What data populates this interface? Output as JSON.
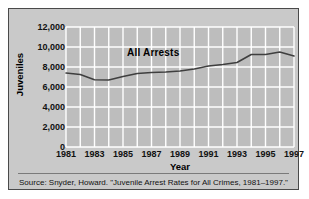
{
  "figure": {
    "series_annotation": "All Arrests",
    "source_caption": "Source: Snyder, Howard. \"Juvenile Arrest Rates for All Crimes, 1981–1997.\"",
    "colors": {
      "panel_background": "#c9c9c9",
      "plot_background": "#bdbdbd",
      "gridline": "#ffffff",
      "line": "#3f3f3f",
      "border": "#4a4a4a",
      "text": "#111111"
    }
  },
  "chart_data": {
    "type": "line",
    "title": "",
    "xlabel": "Year",
    "ylabel": "Juveniles",
    "x": [
      1981,
      1982,
      1983,
      1984,
      1985,
      1986,
      1987,
      1988,
      1989,
      1990,
      1991,
      1992,
      1993,
      1994,
      1995,
      1996,
      1997
    ],
    "series": [
      {
        "name": "All Arrests",
        "values": [
          7400,
          7250,
          6720,
          6700,
          7050,
          7350,
          7450,
          7500,
          7600,
          7800,
          8100,
          8250,
          8450,
          9250,
          9250,
          9500,
          9100
        ]
      }
    ],
    "xticks": [
      1981,
      1983,
      1985,
      1987,
      1989,
      1991,
      1993,
      1995,
      1997
    ],
    "xtick_labels": [
      "1981",
      "1983",
      "1985",
      "1987",
      "1989",
      "1991",
      "1993",
      "1995",
      "1997"
    ],
    "yticks": [
      0,
      2000,
      4000,
      6000,
      8000,
      10000,
      12000
    ],
    "ytick_labels": [
      "0",
      "2,000",
      "4,000",
      "6,000",
      "8,000",
      "10,000",
      "12,000"
    ],
    "xlim": [
      1981,
      1997
    ],
    "ylim": [
      0,
      12000
    ],
    "grid": true,
    "legend": "none"
  }
}
